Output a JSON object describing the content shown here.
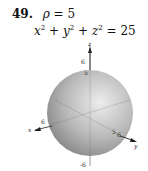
{
  "problem": {
    "number": "49.",
    "condition_symbol": "ρ",
    "condition_rest": " = 5",
    "equation": {
      "terms": [
        "x",
        "y",
        "z"
      ],
      "exponent": "2",
      "plus": "+",
      "equals": "=",
      "rhs": "25"
    }
  },
  "figure": {
    "type": "sphere",
    "radius": 5,
    "axes": {
      "x": {
        "label": "x",
        "tick": "6"
      },
      "y": {
        "label": "y",
        "ticks": [
          "5",
          "6"
        ]
      },
      "z": {
        "label": "z",
        "ticks": [
          "6",
          "5",
          "-6"
        ]
      }
    },
    "colors": {
      "sphere_light": "#e8e8e8",
      "sphere_dark": "#8a8a8a",
      "axis": "#333333"
    }
  }
}
